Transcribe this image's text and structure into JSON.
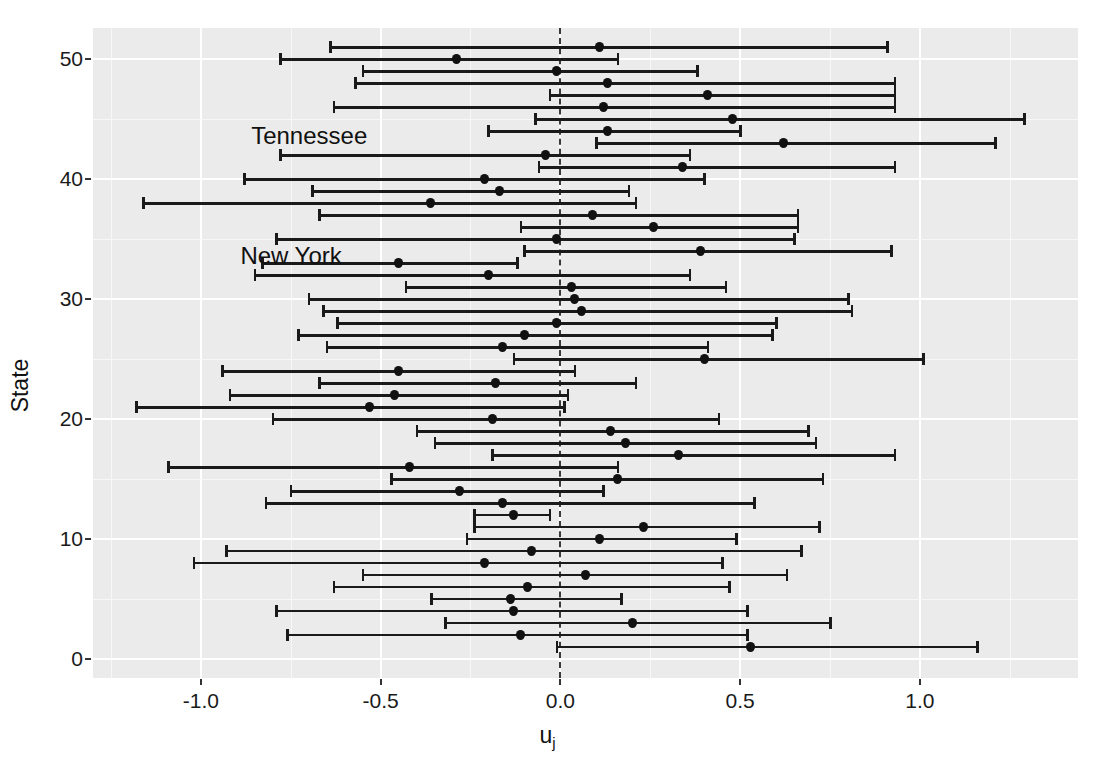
{
  "chart_data": {
    "type": "scatter",
    "plot_style": "caterpillar plot with 95% intervals",
    "title": "",
    "xlabel": "u_j",
    "xlabel_display": "u",
    "xlabel_subscript": "j",
    "ylabel": "State",
    "xlim": [
      -1.3,
      1.44
    ],
    "ylim": [
      -1.6,
      52.6
    ],
    "xticks": [
      -1.0,
      -0.5,
      0.0,
      0.5,
      1.0
    ],
    "xticklabels": [
      "-1.0",
      "-0.5",
      "0.0",
      "0.5",
      "1.0"
    ],
    "yticks": [
      0,
      10,
      20,
      30,
      40,
      50
    ],
    "yticklabels": [
      "0",
      "10",
      "20",
      "30",
      "40",
      "50"
    ],
    "grid": true,
    "legend": false,
    "reference_line": {
      "x": 0.0,
      "style": "dashed",
      "color": "#3a3a3a"
    },
    "annotations": [
      {
        "text": "Tennessee",
        "x": -0.86,
        "y": 43.6
      },
      {
        "text": "New York",
        "x": -0.89,
        "y": 33.6
      }
    ],
    "panel_background": "#ebebeb",
    "point_color": "#111111",
    "series_name": "u_j estimate with interval",
    "points": [
      {
        "state": 51,
        "estimate": 0.11,
        "low": -0.64,
        "high": 0.91
      },
      {
        "state": 50,
        "estimate": -0.29,
        "low": -0.78,
        "high": 0.16
      },
      {
        "state": 49,
        "estimate": -0.01,
        "low": -0.55,
        "high": 0.38
      },
      {
        "state": 48,
        "estimate": 0.13,
        "low": -0.57,
        "high": 0.93
      },
      {
        "state": 47,
        "estimate": 0.41,
        "low": -0.03,
        "high": 0.93
      },
      {
        "state": 46,
        "estimate": 0.12,
        "low": -0.63,
        "high": 0.93
      },
      {
        "state": 45,
        "estimate": 0.48,
        "low": -0.07,
        "high": 1.29
      },
      {
        "state": 44,
        "estimate": 0.13,
        "low": -0.2,
        "high": 0.5
      },
      {
        "state": 43,
        "estimate": 0.62,
        "low": 0.1,
        "high": 1.21
      },
      {
        "state": 42,
        "estimate": -0.04,
        "low": -0.78,
        "high": 0.36
      },
      {
        "state": 41,
        "estimate": 0.34,
        "low": -0.06,
        "high": 0.93
      },
      {
        "state": 40,
        "estimate": -0.21,
        "low": -0.88,
        "high": 0.4
      },
      {
        "state": 39,
        "estimate": -0.17,
        "low": -0.69,
        "high": 0.19
      },
      {
        "state": 38,
        "estimate": -0.36,
        "low": -1.16,
        "high": 0.21
      },
      {
        "state": 37,
        "estimate": 0.09,
        "low": -0.67,
        "high": 0.66
      },
      {
        "state": 36,
        "estimate": 0.26,
        "low": -0.11,
        "high": 0.66
      },
      {
        "state": 35,
        "estimate": -0.01,
        "low": -0.79,
        "high": 0.65
      },
      {
        "state": 34,
        "estimate": 0.39,
        "low": -0.1,
        "high": 0.92
      },
      {
        "state": 33,
        "estimate": -0.45,
        "low": -0.83,
        "high": -0.12
      },
      {
        "state": 32,
        "estimate": -0.2,
        "low": -0.85,
        "high": 0.36
      },
      {
        "state": 31,
        "estimate": 0.03,
        "low": -0.43,
        "high": 0.46
      },
      {
        "state": 30,
        "estimate": 0.04,
        "low": -0.7,
        "high": 0.8
      },
      {
        "state": 29,
        "estimate": 0.06,
        "low": -0.66,
        "high": 0.81
      },
      {
        "state": 28,
        "estimate": -0.01,
        "low": -0.62,
        "high": 0.6
      },
      {
        "state": 27,
        "estimate": -0.1,
        "low": -0.73,
        "high": 0.59
      },
      {
        "state": 26,
        "estimate": -0.16,
        "low": -0.65,
        "high": 0.41
      },
      {
        "state": 25,
        "estimate": 0.4,
        "low": -0.13,
        "high": 1.01
      },
      {
        "state": 24,
        "estimate": -0.45,
        "low": -0.94,
        "high": 0.04
      },
      {
        "state": 23,
        "estimate": -0.18,
        "low": -0.67,
        "high": 0.21
      },
      {
        "state": 22,
        "estimate": -0.46,
        "low": -0.92,
        "high": 0.02
      },
      {
        "state": 21,
        "estimate": -0.53,
        "low": -1.18,
        "high": 0.01
      },
      {
        "state": 20,
        "estimate": -0.19,
        "low": -0.8,
        "high": 0.44
      },
      {
        "state": 19,
        "estimate": 0.14,
        "low": -0.4,
        "high": 0.69
      },
      {
        "state": 18,
        "estimate": 0.18,
        "low": -0.35,
        "high": 0.71
      },
      {
        "state": 17,
        "estimate": 0.33,
        "low": -0.19,
        "high": 0.93
      },
      {
        "state": 16,
        "estimate": -0.42,
        "low": -1.09,
        "high": 0.16
      },
      {
        "state": 15,
        "estimate": 0.16,
        "low": -0.47,
        "high": 0.73
      },
      {
        "state": 14,
        "estimate": -0.28,
        "low": -0.75,
        "high": 0.12
      },
      {
        "state": 13,
        "estimate": -0.16,
        "low": -0.82,
        "high": 0.54
      },
      {
        "state": 12,
        "estimate": -0.13,
        "low": -0.24,
        "high": -0.03
      },
      {
        "state": 11,
        "estimate": 0.23,
        "low": -0.24,
        "high": 0.72
      },
      {
        "state": 10,
        "estimate": 0.11,
        "low": -0.26,
        "high": 0.49
      },
      {
        "state": 9,
        "estimate": -0.08,
        "low": -0.93,
        "high": 0.67
      },
      {
        "state": 8,
        "estimate": -0.21,
        "low": -1.02,
        "high": 0.45
      },
      {
        "state": 7,
        "estimate": 0.07,
        "low": -0.55,
        "high": 0.63
      },
      {
        "state": 6,
        "estimate": -0.09,
        "low": -0.63,
        "high": 0.47
      },
      {
        "state": 5,
        "estimate": -0.14,
        "low": -0.36,
        "high": 0.17
      },
      {
        "state": 4,
        "estimate": -0.13,
        "low": -0.79,
        "high": 0.52
      },
      {
        "state": 3,
        "estimate": 0.2,
        "low": -0.32,
        "high": 0.75
      },
      {
        "state": 2,
        "estimate": -0.11,
        "low": -0.76,
        "high": 0.52
      },
      {
        "state": 1,
        "estimate": 0.53,
        "low": -0.01,
        "high": 1.16
      }
    ]
  }
}
